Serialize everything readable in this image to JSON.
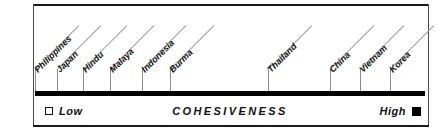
{
  "chart_data": {
    "type": "scatter",
    "title": "",
    "xlabel": "COHESIVENESS",
    "ylabel": "",
    "orientation": "horizontal-scale",
    "grid": false,
    "legend_position": "below-axis",
    "axis": {
      "low_label": "Low",
      "high_label": "High",
      "low_marker": "open-square",
      "high_marker": "filled-square",
      "xlim": [
        0,
        100
      ]
    },
    "categories": [
      "Philippines",
      "Japan",
      "Hindu",
      "Malaya",
      "Indonesia",
      "Burma",
      "Thailand",
      "China",
      "Vietnam",
      "Korea"
    ],
    "values": [
      0.0,
      5.6,
      12.3,
      19.2,
      27.4,
      34.6,
      59.7,
      75.6,
      83.3,
      91.0
    ],
    "points": [
      {
        "label": "Philippines",
        "value": 0.0,
        "x_px": 35
      },
      {
        "label": "Japan",
        "value": 5.6,
        "x_px": 57
      },
      {
        "label": "Hindu",
        "value": 12.3,
        "x_px": 83
      },
      {
        "label": "Malaya",
        "value": 19.2,
        "x_px": 110
      },
      {
        "label": "Indonesia",
        "value": 27.4,
        "x_px": 142
      },
      {
        "label": "Burma",
        "value": 34.6,
        "x_px": 170
      },
      {
        "label": "Thailand",
        "value": 59.7,
        "x_px": 268
      },
      {
        "label": "China",
        "value": 75.6,
        "x_px": 330
      },
      {
        "label": "Vietnam",
        "value": 83.3,
        "x_px": 360
      },
      {
        "label": "Korea",
        "value": 91.0,
        "x_px": 390
      }
    ],
    "colors": {
      "axis": "#000000",
      "tick": "#8c8c8c",
      "leader": "#9a9a9a",
      "text": "#111111",
      "background": "#ffffff"
    }
  }
}
